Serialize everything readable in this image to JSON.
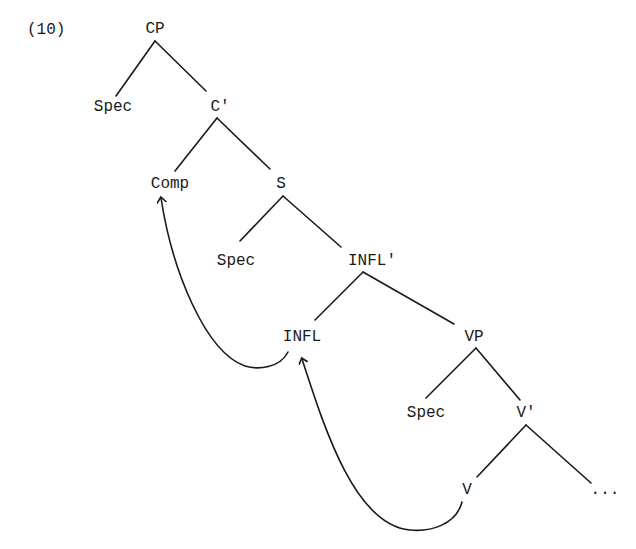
{
  "example_number": "(10)",
  "tree": {
    "nodes": {
      "cp": "CP",
      "cp_spec": "Spec",
      "c_bar": "C'",
      "comp": "Comp",
      "s": "S",
      "s_spec": "Spec",
      "infl_bar": "INFL'",
      "infl": "INFL",
      "vp": "VP",
      "vp_spec": "Spec",
      "v_bar": "V'",
      "v": "V",
      "ellipsis": "..."
    },
    "movements": [
      {
        "from": "V",
        "to": "INFL",
        "type": "head-movement"
      },
      {
        "from": "INFL",
        "to": "Comp",
        "type": "head-movement"
      }
    ]
  },
  "colors": {
    "ink": "#1a1a1a",
    "background": "#ffffff"
  }
}
